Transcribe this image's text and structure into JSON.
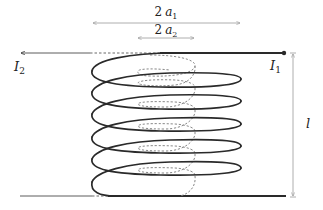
{
  "figure": {
    "colors": {
      "outer_coil": "#2a2a2a",
      "inner_coil": "#888888",
      "dimension_lines": "#999999",
      "labels": "#222222"
    },
    "labels": {
      "outer_diameter_coef": "2",
      "outer_diameter_var": "a",
      "outer_diameter_sub": "1",
      "inner_diameter_coef": "2",
      "inner_diameter_var": "a",
      "inner_diameter_sub": "2",
      "current_outer_var": "I",
      "current_outer_sub": "1",
      "current_inner_var": "I",
      "current_inner_sub": "2",
      "length": "l"
    },
    "outer_coil": {
      "style": "solid",
      "turns": 6,
      "left_x": 92,
      "right_x": 241
    },
    "inner_coil": {
      "style": "dashed",
      "turns": 6,
      "left_x": 137,
      "right_x": 195
    },
    "dimensions": {
      "outer_diameter_span": [
        92,
        241
      ],
      "inner_diameter_span": [
        137,
        195
      ],
      "length_span": [
        53,
        197
      ]
    }
  }
}
